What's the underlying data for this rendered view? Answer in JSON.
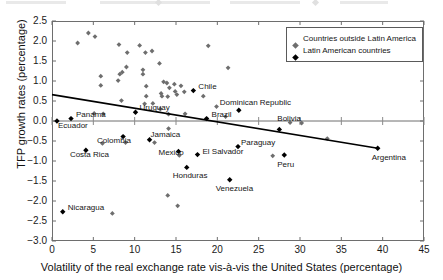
{
  "chart_data": {
    "type": "scatter",
    "title": "",
    "xlabel": "Volatility of the real exchange rate vis-à-vis the United States (percentage)",
    "ylabel": "TFP growth rates (percentage)",
    "xlim": [
      0,
      45
    ],
    "ylim": [
      -3.0,
      2.5
    ],
    "xticks": [
      "0",
      "5",
      "10",
      "15",
      "20",
      "25",
      "30",
      "35",
      "40",
      "45"
    ],
    "yticks": [
      "2.5",
      "2.0",
      "1.5",
      "1.0",
      "0.5",
      "0.0",
      "−0.5",
      "−1.0",
      "−1.5",
      "−2.0",
      "−2.5",
      "−3.0"
    ],
    "grid": false,
    "legend_position": "top-right",
    "legend": [
      {
        "label": "Countries outside Latin America",
        "marker": "grey-diamond",
        "color": "#6e6e6e"
      },
      {
        "label": "Latin American countries",
        "marker": "black-diamond",
        "color": "#000000"
      }
    ],
    "trendline": {
      "label": "linear fit",
      "color": "#000000",
      "x0": 0.0,
      "y0": 0.66,
      "x1": 39.4,
      "y1": -0.68
    },
    "series": [
      {
        "name": "Latin American countries",
        "marker": "black-diamond",
        "color": "#000000",
        "labelled": true,
        "points": [
          {
            "label": "Ecuador",
            "x": 0.6,
            "y": 0.0,
            "label_dx": 1,
            "label_dy": 5
          },
          {
            "label": "Panama",
            "x": 2.3,
            "y": 0.06,
            "label_dx": 5,
            "label_dy": -4
          },
          {
            "label": "Nicaragua",
            "x": 1.3,
            "y": -2.27,
            "label_dx": 5,
            "label_dy": -4
          },
          {
            "label": "Costa Rica",
            "x": 4.1,
            "y": -0.73,
            "label_dx": -16,
            "label_dy": 5
          },
          {
            "label": "Uruguay",
            "x": 10.1,
            "y": 0.22,
            "label_dx": 4,
            "label_dy": -4
          },
          {
            "label": "Colombia",
            "x": 8.6,
            "y": -0.39,
            "label_dx": -26,
            "label_dy": 4
          },
          {
            "label": "Jamaica",
            "x": 11.8,
            "y": -0.47,
            "label_dx": 1,
            "label_dy": -5
          },
          {
            "label": "Mexico",
            "x": 15.3,
            "y": -0.76,
            "label_dx": -20,
            "label_dy": 2
          },
          {
            "label": "Chile",
            "x": 17.1,
            "y": 0.76,
            "label_dx": 5,
            "label_dy": -4
          },
          {
            "label": "Honduras",
            "x": 16.3,
            "y": -1.16,
            "label_dx": -14,
            "label_dy": 9
          },
          {
            "label": "El Salvador",
            "x": 17.6,
            "y": -0.84,
            "label_dx": 5,
            "label_dy": -3
          },
          {
            "label": "Brazil",
            "x": 18.7,
            "y": 0.06,
            "label_dx": 5,
            "label_dy": -4
          },
          {
            "label": "Venezuela",
            "x": 21.5,
            "y": -1.47,
            "label_dx": -14,
            "label_dy": 9
          },
          {
            "label": "Dominican Republic",
            "x": 22.6,
            "y": 0.27,
            "label_dx": -19,
            "label_dy": -7
          },
          {
            "label": "Paraguay",
            "x": 22.5,
            "y": -0.64,
            "label_dx": 3,
            "label_dy": -4
          },
          {
            "label": "Bolivia",
            "x": 27.5,
            "y": -0.21,
            "label_dx": -2,
            "label_dy": -10
          },
          {
            "label": "Peru",
            "x": 28.1,
            "y": -0.85,
            "label_dx": -7,
            "label_dy": 10
          },
          {
            "label": "Argentina",
            "x": 39.4,
            "y": -0.68,
            "label_dx": -6,
            "label_dy": 10
          }
        ]
      },
      {
        "name": "Countries outside Latin America",
        "marker": "grey-diamond",
        "color": "#6e6e6e",
        "labelled": false,
        "points": [
          {
            "x": 3.1,
            "y": 1.95
          },
          {
            "x": 4.4,
            "y": 2.2
          },
          {
            "x": 5.2,
            "y": 2.11
          },
          {
            "x": 5.9,
            "y": 1.12
          },
          {
            "x": 5.9,
            "y": 0.89
          },
          {
            "x": 6.1,
            "y": -0.56
          },
          {
            "x": 5.1,
            "y": 0.19
          },
          {
            "x": 7.3,
            "y": -2.31
          },
          {
            "x": 6.2,
            "y": 0.18
          },
          {
            "x": 8.1,
            "y": 1.91
          },
          {
            "x": 8.2,
            "y": 1.17
          },
          {
            "x": 8.5,
            "y": 1.22
          },
          {
            "x": 8.0,
            "y": 1.01
          },
          {
            "x": 8.4,
            "y": 0.51
          },
          {
            "x": 9.1,
            "y": 1.71
          },
          {
            "x": 9.0,
            "y": 1.35
          },
          {
            "x": 8.9,
            "y": -0.54
          },
          {
            "x": 10.6,
            "y": 1.89
          },
          {
            "x": 11.0,
            "y": 1.17
          },
          {
            "x": 11.0,
            "y": 1.28
          },
          {
            "x": 11.3,
            "y": 1.71
          },
          {
            "x": 11.4,
            "y": 0.87
          },
          {
            "x": 11.4,
            "y": 0.62
          },
          {
            "x": 11.2,
            "y": 0.43
          },
          {
            "x": 12.1,
            "y": 1.75
          },
          {
            "x": 12.2,
            "y": 0.44
          },
          {
            "x": 12.4,
            "y": -0.54
          },
          {
            "x": 13.0,
            "y": 1.44
          },
          {
            "x": 13.2,
            "y": 0.69
          },
          {
            "x": 13.3,
            "y": 0.62
          },
          {
            "x": 13.1,
            "y": 0.3
          },
          {
            "x": 13.5,
            "y": 0.98
          },
          {
            "x": 13.9,
            "y": 0.95
          },
          {
            "x": 14.2,
            "y": 0.83
          },
          {
            "x": 14.0,
            "y": 0.61
          },
          {
            "x": 14.1,
            "y": 0.17
          },
          {
            "x": 14.0,
            "y": -1.86
          },
          {
            "x": 14.1,
            "y": -0.19
          },
          {
            "x": 14.8,
            "y": 0.92
          },
          {
            "x": 14.9,
            "y": 0.74
          },
          {
            "x": 15.1,
            "y": 0.66
          },
          {
            "x": 15.2,
            "y": -2.12
          },
          {
            "x": 15.4,
            "y": -0.86
          },
          {
            "x": 15.6,
            "y": 0.88
          },
          {
            "x": 16.0,
            "y": 0.73
          },
          {
            "x": 16.1,
            "y": 0.18
          },
          {
            "x": 18.3,
            "y": 0.62
          },
          {
            "x": 18.9,
            "y": 1.88
          },
          {
            "x": 19.9,
            "y": 0.36
          },
          {
            "x": 21.0,
            "y": 0.11
          },
          {
            "x": 21.3,
            "y": 1.33
          },
          {
            "x": 26.7,
            "y": -0.87
          },
          {
            "x": 28.8,
            "y": -0.04
          },
          {
            "x": 30.2,
            "y": -0.05
          },
          {
            "x": 33.3,
            "y": -0.44
          }
        ]
      }
    ]
  }
}
